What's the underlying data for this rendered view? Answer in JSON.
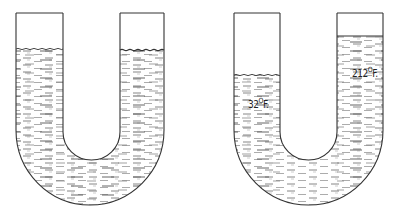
{
  "figure": {
    "left_tube": {
      "state": "equal levels",
      "left_level_y": 49,
      "right_level_y": 49
    },
    "right_tube": {
      "state": "unequal levels due to temperature difference",
      "left_label": {
        "value": "32",
        "unit": "F."
      },
      "right_label": {
        "value": "212",
        "unit": "F."
      },
      "left_level_y": 75,
      "right_level_y": 36
    },
    "colors": {
      "line": "#333333",
      "hatch": "#555555",
      "background": "#ffffff"
    }
  }
}
